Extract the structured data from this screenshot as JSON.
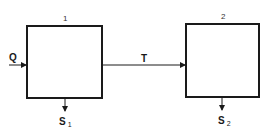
{
  "diagram": {
    "nodes": [
      {
        "id": "box-1",
        "label": "1"
      },
      {
        "id": "box-2",
        "label": "2"
      }
    ],
    "edges": [
      {
        "from": "input",
        "to": "box-1",
        "label": "Q"
      },
      {
        "from": "box-1",
        "to": "box-2",
        "label": "T"
      },
      {
        "from": "box-1",
        "to": "output-1",
        "label": "S",
        "subscript": "1"
      },
      {
        "from": "box-2",
        "to": "output-2",
        "label": "S",
        "subscript": "2"
      }
    ],
    "colors": {
      "stroke": "#1a1a1a",
      "background": "#ffffff"
    }
  }
}
